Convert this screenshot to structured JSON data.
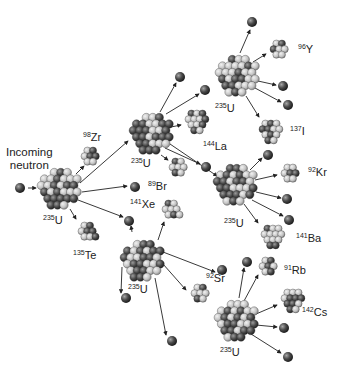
{
  "incoming_label": [
    "Incoming",
    "neutron"
  ],
  "colors": {
    "neutron": "#3a3a3a",
    "proton_light": "#c8c8c8",
    "nucleon_dark": "#4a4a4a",
    "arrow": "#222222",
    "text": "#222222"
  },
  "incoming_neutron": {
    "x": 20,
    "y": 188
  },
  "nuclei": [
    {
      "id": "u1",
      "mass": "235",
      "symbol": "U",
      "x": 60,
      "y": 188,
      "r": 22,
      "lx": 43,
      "ly": 214
    },
    {
      "id": "zr",
      "mass": "98",
      "symbol": "Zr",
      "x": 90,
      "y": 156,
      "r": 11,
      "lx": 83,
      "ly": 131
    },
    {
      "id": "te",
      "mass": "135",
      "symbol": "Te",
      "x": 88,
      "y": 232,
      "r": 12,
      "lx": 73,
      "ly": 249
    },
    {
      "id": "u2",
      "mass": "235",
      "symbol": "U",
      "x": 152,
      "y": 133,
      "r": 22,
      "lx": 131,
      "ly": 157
    },
    {
      "id": "la",
      "mass": "144",
      "symbol": "La",
      "x": 196,
      "y": 121,
      "r": 13,
      "lx": 203,
      "ly": 140
    },
    {
      "id": "br",
      "mass": "89",
      "symbol": "Br",
      "x": 178,
      "y": 167,
      "r": 11,
      "lx": 148,
      "ly": 180
    },
    {
      "id": "u4",
      "mass": "235",
      "symbol": "U",
      "x": 238,
      "y": 75,
      "r": 22,
      "lx": 215,
      "ly": 102
    },
    {
      "id": "y",
      "mass": "96",
      "symbol": "Y",
      "x": 279,
      "y": 49,
      "r": 11,
      "lx": 298,
      "ly": 43
    },
    {
      "id": "i",
      "mass": "137",
      "symbol": "I",
      "x": 270,
      "y": 131,
      "r": 13,
      "lx": 290,
      "ly": 125
    },
    {
      "id": "u5",
      "mass": "235",
      "symbol": "U",
      "x": 236,
      "y": 184,
      "r": 22,
      "lx": 224,
      "ly": 217
    },
    {
      "id": "kr",
      "mass": "92",
      "symbol": "Kr",
      "x": 290,
      "y": 173,
      "r": 11,
      "lx": 308,
      "ly": 166
    },
    {
      "id": "ba",
      "mass": "141",
      "symbol": "Ba",
      "x": 272,
      "y": 236,
      "r": 13,
      "lx": 296,
      "ly": 232
    },
    {
      "id": "xe",
      "mass": "141",
      "symbol": "Xe",
      "x": 172,
      "y": 210,
      "r": 12,
      "lx": 130,
      "ly": 198
    },
    {
      "id": "u3",
      "mass": "235",
      "symbol": "U",
      "x": 143,
      "y": 260,
      "r": 22,
      "lx": 128,
      "ly": 283
    },
    {
      "id": "sr",
      "mass": "92",
      "symbol": "Sr",
      "x": 200,
      "y": 293,
      "r": 11,
      "lx": 206,
      "ly": 272
    },
    {
      "id": "rb",
      "mass": "91",
      "symbol": "Rb",
      "x": 268,
      "y": 266,
      "r": 11,
      "lx": 284,
      "ly": 264
    },
    {
      "id": "cs",
      "mass": "142",
      "symbol": "Cs",
      "x": 292,
      "y": 300,
      "r": 13,
      "lx": 302,
      "ly": 306
    },
    {
      "id": "u6",
      "mass": "235",
      "symbol": "U",
      "x": 237,
      "y": 320,
      "r": 22,
      "lx": 220,
      "ly": 346
    }
  ],
  "neutrons": [
    {
      "x": 135,
      "y": 187
    },
    {
      "x": 129,
      "y": 221
    },
    {
      "x": 180,
      "y": 77
    },
    {
      "x": 205,
      "y": 90
    },
    {
      "x": 206,
      "y": 167
    },
    {
      "x": 252,
      "y": 22
    },
    {
      "x": 283,
      "y": 86
    },
    {
      "x": 288,
      "y": 105
    },
    {
      "x": 268,
      "y": 155
    },
    {
      "x": 287,
      "y": 199
    },
    {
      "x": 289,
      "y": 220
    },
    {
      "x": 126,
      "y": 298
    },
    {
      "x": 172,
      "y": 341
    },
    {
      "x": 222,
      "y": 270
    },
    {
      "x": 247,
      "y": 262
    },
    {
      "x": 284,
      "y": 328
    },
    {
      "x": 288,
      "y": 357
    }
  ],
  "arrows": [
    {
      "x1": 28,
      "y1": 188,
      "x2": 36,
      "y2": 188
    },
    {
      "x1": 76,
      "y1": 174,
      "x2": 84,
      "y2": 166
    },
    {
      "x1": 80,
      "y1": 183,
      "x2": 128,
      "y2": 141
    },
    {
      "x1": 82,
      "y1": 192,
      "x2": 127,
      "y2": 186
    },
    {
      "x1": 78,
      "y1": 200,
      "x2": 123,
      "y2": 217
    },
    {
      "x1": 70,
      "y1": 209,
      "x2": 76,
      "y2": 219
    },
    {
      "x1": 160,
      "y1": 112,
      "x2": 176,
      "y2": 83
    },
    {
      "x1": 166,
      "y1": 114,
      "x2": 199,
      "y2": 94
    },
    {
      "x1": 171,
      "y1": 127,
      "x2": 181,
      "y2": 125
    },
    {
      "x1": 161,
      "y1": 155,
      "x2": 168,
      "y2": 160
    },
    {
      "x1": 165,
      "y1": 148,
      "x2": 200,
      "y2": 164
    },
    {
      "x1": 170,
      "y1": 144,
      "x2": 217,
      "y2": 176
    },
    {
      "x1": 240,
      "y1": 53,
      "x2": 250,
      "y2": 30
    },
    {
      "x1": 253,
      "y1": 62,
      "x2": 266,
      "y2": 54
    },
    {
      "x1": 258,
      "y1": 81,
      "x2": 276,
      "y2": 85
    },
    {
      "x1": 255,
      "y1": 88,
      "x2": 281,
      "y2": 102
    },
    {
      "x1": 246,
      "y1": 96,
      "x2": 259,
      "y2": 117
    },
    {
      "x1": 250,
      "y1": 170,
      "x2": 262,
      "y2": 158
    },
    {
      "x1": 255,
      "y1": 180,
      "x2": 277,
      "y2": 175
    },
    {
      "x1": 256,
      "y1": 192,
      "x2": 281,
      "y2": 198
    },
    {
      "x1": 252,
      "y1": 200,
      "x2": 283,
      "y2": 216
    },
    {
      "x1": 244,
      "y1": 204,
      "x2": 258,
      "y2": 223
    },
    {
      "x1": 158,
      "y1": 240,
      "x2": 164,
      "y2": 222
    },
    {
      "x1": 163,
      "y1": 252,
      "x2": 215,
      "y2": 272
    },
    {
      "x1": 163,
      "y1": 264,
      "x2": 186,
      "y2": 290
    },
    {
      "x1": 155,
      "y1": 278,
      "x2": 166,
      "y2": 335
    },
    {
      "x1": 122,
      "y1": 267,
      "x2": 121,
      "y2": 293
    },
    {
      "x1": 132,
      "y1": 232,
      "x2": 131,
      "y2": 226
    },
    {
      "x1": 239,
      "y1": 298,
      "x2": 244,
      "y2": 268
    },
    {
      "x1": 244,
      "y1": 301,
      "x2": 258,
      "y2": 275
    },
    {
      "x1": 256,
      "y1": 314,
      "x2": 277,
      "y2": 305
    },
    {
      "x1": 256,
      "y1": 325,
      "x2": 277,
      "y2": 327
    },
    {
      "x1": 251,
      "y1": 334,
      "x2": 281,
      "y2": 353
    }
  ]
}
